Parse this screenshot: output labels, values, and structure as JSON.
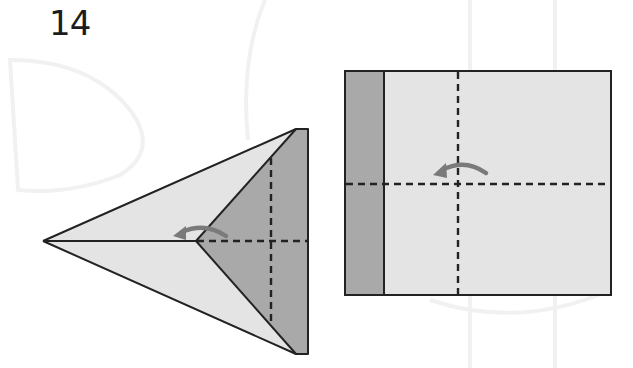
{
  "step": {
    "number": "14"
  },
  "colors": {
    "paper_light": "#e4e4e4",
    "paper_dark": "#a9a9a9",
    "outline": "#222222",
    "fold_line": "#222222",
    "arrow": "#7a7a7a",
    "watermark": "#f2f2f2",
    "background": "#ffffff"
  },
  "diagrams": [
    {
      "name": "folded-plane-side-view",
      "description": "Triangular folded paper with dark flap on right, valley fold lines and fold arrow",
      "fold_lines": [
        "vertical-dashed",
        "horizontal-dashed"
      ],
      "arrow": "curved-fold-arrow-left"
    },
    {
      "name": "unfolded-square-view",
      "description": "Rectangle with dark strip on left, crossing dashed fold lines and fold arrow",
      "fold_lines": [
        "vertical-dashed",
        "horizontal-dashed"
      ],
      "arrow": "curved-fold-arrow-left"
    }
  ]
}
